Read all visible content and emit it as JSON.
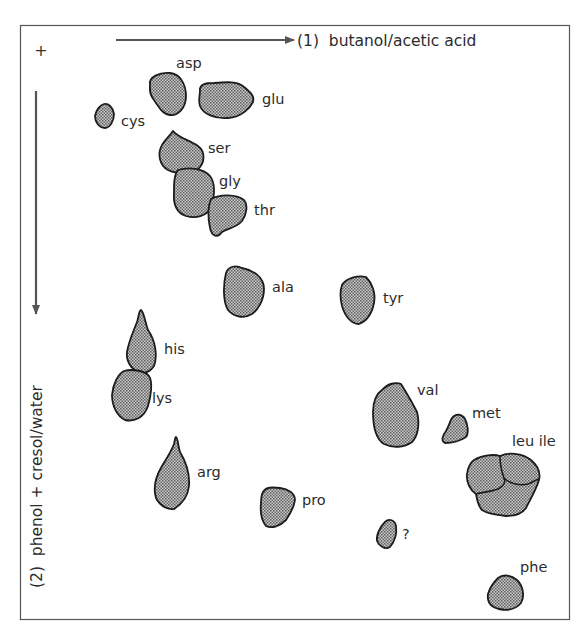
{
  "figure": {
    "origin_marker": "+",
    "axis1": {
      "label": "(1)  butanol/acetic acid",
      "direction": "right"
    },
    "axis2": {
      "label": "(2)  phenol + cresol/water",
      "direction": "down"
    },
    "colors": {
      "frame": "#555555",
      "arrow": "#555555",
      "spot_stroke": "#1c1c1c",
      "spot_fill": "#a8a8a8"
    }
  },
  "spots": [
    {
      "id": "asp",
      "label": "asp"
    },
    {
      "id": "glu",
      "label": "glu"
    },
    {
      "id": "cys",
      "label": "cys"
    },
    {
      "id": "ser",
      "label": "ser"
    },
    {
      "id": "gly",
      "label": "gly"
    },
    {
      "id": "thr",
      "label": "thr"
    },
    {
      "id": "ala",
      "label": "ala"
    },
    {
      "id": "tyr",
      "label": "tyr"
    },
    {
      "id": "his",
      "label": "his"
    },
    {
      "id": "lys",
      "label": "lys"
    },
    {
      "id": "val",
      "label": "val"
    },
    {
      "id": "met",
      "label": "met"
    },
    {
      "id": "leu-ile",
      "label": "leu ile"
    },
    {
      "id": "arg",
      "label": "arg"
    },
    {
      "id": "pro",
      "label": "pro"
    },
    {
      "id": "unknown",
      "label": "?"
    },
    {
      "id": "phe",
      "label": "phe"
    }
  ]
}
